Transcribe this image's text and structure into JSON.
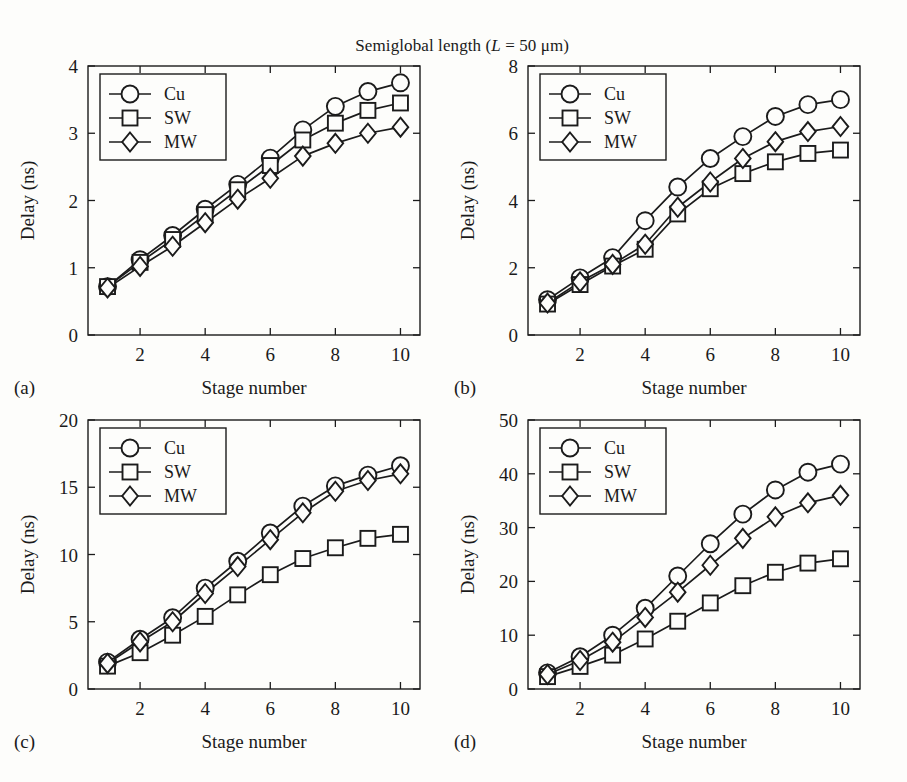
{
  "figure": {
    "title": "Semiglobal length (L = 50 μm)",
    "title_prefix": "Semiglobal length (",
    "title_var": "L",
    "title_suffix": " = 50 μm)"
  },
  "legend": {
    "entries": [
      {
        "label": "Cu",
        "marker": "circle-marker"
      },
      {
        "label": "SW",
        "marker": "square-marker"
      },
      {
        "label": "MW",
        "marker": "diamond-marker"
      }
    ]
  },
  "axis_titles": {
    "x": "Stage number",
    "y": "Delay (ns)"
  },
  "panels": [
    {
      "id": "a",
      "letter": "(a)"
    },
    {
      "id": "b",
      "letter": "(b)"
    },
    {
      "id": "c",
      "letter": "(c)"
    },
    {
      "id": "d",
      "letter": "(d)"
    }
  ],
  "chart_data": [
    {
      "type": "line",
      "panel": "a",
      "panel_letter": "(a)",
      "title": "Semiglobal length (L = 50 μm)",
      "xlabel": "Stage number",
      "ylabel": "Delay (ns)",
      "x": [
        1,
        2,
        3,
        4,
        5,
        6,
        7,
        8,
        9,
        10
      ],
      "xlim": [
        0.4,
        10.6
      ],
      "ylim": [
        0,
        4
      ],
      "xticks": [
        2,
        4,
        6,
        8,
        10
      ],
      "yticks": [
        0,
        1,
        2,
        3,
        4
      ],
      "grid": false,
      "legend_position": "upper-left",
      "series": [
        {
          "name": "Cu",
          "marker": "circle",
          "values": [
            0.72,
            1.12,
            1.48,
            1.87,
            2.24,
            2.63,
            3.05,
            3.4,
            3.62,
            3.75
          ]
        },
        {
          "name": "SW",
          "marker": "square",
          "values": [
            0.72,
            1.08,
            1.42,
            1.79,
            2.16,
            2.52,
            2.9,
            3.15,
            3.34,
            3.45
          ]
        },
        {
          "name": "MW",
          "marker": "diamond",
          "values": [
            0.7,
            1.02,
            1.32,
            1.67,
            2.02,
            2.33,
            2.66,
            2.85,
            3.0,
            3.09
          ]
        }
      ]
    },
    {
      "type": "line",
      "panel": "b",
      "panel_letter": "(b)",
      "title": "Semiglobal length (L = 50 μm)",
      "xlabel": "Stage number",
      "ylabel": "Delay (ns)",
      "x": [
        1,
        2,
        3,
        4,
        5,
        6,
        7,
        8,
        9,
        10
      ],
      "xlim": [
        0.4,
        10.6
      ],
      "ylim": [
        0,
        8
      ],
      "xticks": [
        2,
        4,
        6,
        8,
        10
      ],
      "yticks": [
        0,
        2,
        4,
        6,
        8
      ],
      "grid": false,
      "legend_position": "upper-left",
      "series": [
        {
          "name": "Cu",
          "marker": "circle",
          "values": [
            1.05,
            1.7,
            2.3,
            3.4,
            4.4,
            5.25,
            5.9,
            6.5,
            6.85,
            7.0
          ]
        },
        {
          "name": "SW",
          "marker": "square",
          "values": [
            0.92,
            1.5,
            2.05,
            2.55,
            3.6,
            4.35,
            4.8,
            5.15,
            5.4,
            5.5
          ]
        },
        {
          "name": "MW",
          "marker": "diamond",
          "values": [
            0.95,
            1.58,
            2.1,
            2.7,
            3.8,
            4.55,
            5.25,
            5.75,
            6.05,
            6.2
          ]
        }
      ]
    },
    {
      "type": "line",
      "panel": "c",
      "panel_letter": "(c)",
      "title": "Semiglobal length (L = 50 μm)",
      "xlabel": "Stage number",
      "ylabel": "Delay (ns)",
      "x": [
        1,
        2,
        3,
        4,
        5,
        6,
        7,
        8,
        9,
        10
      ],
      "xlim": [
        0.4,
        10.6
      ],
      "ylim": [
        0,
        20
      ],
      "xticks": [
        2,
        4,
        6,
        8,
        10
      ],
      "yticks": [
        0,
        5,
        10,
        15,
        20
      ],
      "grid": false,
      "legend_position": "upper-left",
      "series": [
        {
          "name": "Cu",
          "marker": "circle",
          "values": [
            2.0,
            3.7,
            5.3,
            7.5,
            9.5,
            11.6,
            13.6,
            15.1,
            15.9,
            16.6
          ]
        },
        {
          "name": "SW",
          "marker": "square",
          "values": [
            1.7,
            2.7,
            4.0,
            5.4,
            7.0,
            8.5,
            9.7,
            10.5,
            11.2,
            11.5
          ]
        },
        {
          "name": "MW",
          "marker": "diamond",
          "values": [
            1.9,
            3.5,
            5.0,
            7.1,
            9.1,
            11.1,
            13.1,
            14.7,
            15.5,
            16.0
          ]
        }
      ]
    },
    {
      "type": "line",
      "panel": "d",
      "panel_letter": "(d)",
      "title": "Semiglobal length (L = 50 μm)",
      "xlabel": "Stage number",
      "ylabel": "Delay (ns)",
      "x": [
        1,
        2,
        3,
        4,
        5,
        6,
        7,
        8,
        9,
        10
      ],
      "xlim": [
        0.4,
        10.6
      ],
      "ylim": [
        0,
        50
      ],
      "xticks": [
        2,
        4,
        6,
        8,
        10
      ],
      "yticks": [
        0,
        10,
        20,
        30,
        40,
        50
      ],
      "grid": false,
      "legend_position": "upper-left",
      "series": [
        {
          "name": "Cu",
          "marker": "circle",
          "values": [
            3.0,
            6.0,
            10.0,
            15.0,
            21.0,
            27.0,
            32.5,
            37.0,
            40.3,
            41.8
          ]
        },
        {
          "name": "SW",
          "marker": "square",
          "values": [
            2.3,
            4.2,
            6.3,
            9.3,
            12.6,
            16.0,
            19.2,
            21.7,
            23.4,
            24.2
          ]
        },
        {
          "name": "MW",
          "marker": "diamond",
          "values": [
            2.7,
            5.3,
            8.7,
            13.3,
            18.0,
            23.0,
            28.0,
            32.0,
            34.6,
            36.0
          ]
        }
      ]
    }
  ]
}
